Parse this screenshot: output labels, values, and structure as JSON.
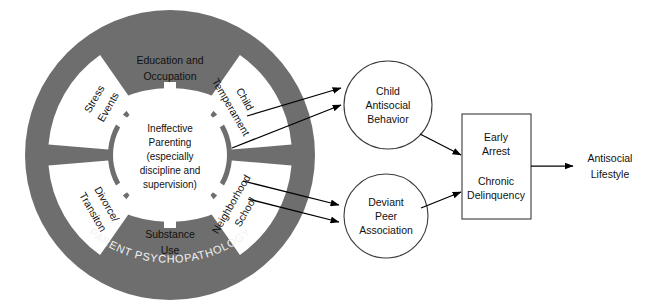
{
  "diagram": {
    "colors": {
      "ring_gray": "#6e6e6e",
      "wedge_white": "#ffffff",
      "stroke_black": "#000000",
      "node_stroke": "#3a3a3a",
      "arc_text": "#f2f2f2",
      "background": "#ffffff"
    },
    "wheel": {
      "arc_label": "PARENT PSYCHOPATHOLOGY",
      "hub": {
        "lines": [
          "Ineffective",
          "Parenting",
          "(especially",
          "discipline and",
          "supervision)"
        ]
      },
      "segments": [
        {
          "id": "education-occupation",
          "lines": [
            "Education and",
            "Occupation"
          ],
          "position": "top"
        },
        {
          "id": "child-temperament",
          "lines": [
            "Child",
            "Temperament"
          ],
          "position": "top-right"
        },
        {
          "id": "neighborhood-school",
          "lines": [
            "Neighborhood",
            "School"
          ],
          "position": "bottom-right"
        },
        {
          "id": "substance-use",
          "lines": [
            "Substance",
            "Use"
          ],
          "position": "bottom"
        },
        {
          "id": "divorce-transition",
          "lines": [
            "Divorce/",
            "Transiton"
          ],
          "position": "bottom-left"
        },
        {
          "id": "stress-events",
          "lines": [
            "Stress",
            "Events"
          ],
          "position": "top-left"
        }
      ]
    },
    "nodes": {
      "child_antisocial": {
        "lines": [
          "Child",
          "Antisocial",
          "Behavior"
        ]
      },
      "deviant_peer": {
        "lines": [
          "Deviant",
          "Peer",
          "Association"
        ]
      },
      "early_arrest_box": {
        "lines_top": [
          "Early",
          "Arrest"
        ],
        "lines_bottom": [
          "Chronic",
          "Delinquency"
        ]
      },
      "antisocial_lifestyle": {
        "lines": [
          "Antisocial",
          "Lifestyle"
        ]
      }
    }
  }
}
